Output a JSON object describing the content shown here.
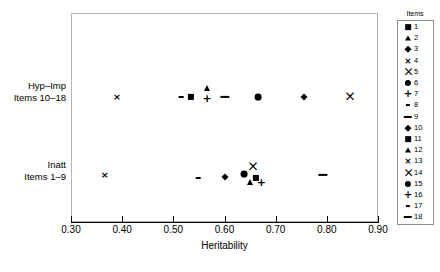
{
  "chart_data": {
    "type": "scatter",
    "title": "",
    "xlabel": "Heritability",
    "ylabel": "",
    "xlim": [
      0.3,
      0.9
    ],
    "xticks": [
      "0.30",
      "0.40",
      "0.50",
      "0.60",
      "0.70",
      "0.80",
      "0.90"
    ],
    "xtick_values": [
      0.3,
      0.4,
      0.5,
      0.6,
      0.7,
      0.8,
      0.9
    ],
    "grid": false,
    "legend_position": "right",
    "legend_title": "Items",
    "categories": [
      {
        "id": "hyp-imp",
        "line1": "Hyp–Imp",
        "line2": "Items 10–18"
      },
      {
        "id": "inatt",
        "line1": "Inatt",
        "line2": "Items 1–9"
      }
    ],
    "legend_entries": [
      {
        "label": "1",
        "marker": "square"
      },
      {
        "label": "2",
        "marker": "triangle"
      },
      {
        "label": "3",
        "marker": "diamond"
      },
      {
        "label": "4",
        "marker": "cross-x"
      },
      {
        "label": "5",
        "marker": "bowtie-x"
      },
      {
        "label": "6",
        "marker": "circle"
      },
      {
        "label": "7",
        "marker": "plus"
      },
      {
        "label": "8",
        "marker": "short-dash"
      },
      {
        "label": "9",
        "marker": "long-dash"
      },
      {
        "label": "10",
        "marker": "diamond"
      },
      {
        "label": "11",
        "marker": "square"
      },
      {
        "label": "12",
        "marker": "triangle"
      },
      {
        "label": "13",
        "marker": "cross-x"
      },
      {
        "label": "14",
        "marker": "bowtie-x"
      },
      {
        "label": "15",
        "marker": "circle"
      },
      {
        "label": "16",
        "marker": "plus"
      },
      {
        "label": "17",
        "marker": "short-dash"
      },
      {
        "label": "18",
        "marker": "long-dash"
      }
    ],
    "points": [
      {
        "item": "13",
        "category": "hyp-imp",
        "x": 0.39,
        "marker": "cross-x",
        "dy": 0
      },
      {
        "item": "17",
        "category": "hyp-imp",
        "x": 0.515,
        "marker": "short-dash",
        "dy": 0
      },
      {
        "item": "11",
        "category": "hyp-imp",
        "x": 0.535,
        "marker": "square",
        "dy": 0
      },
      {
        "item": "12",
        "category": "hyp-imp",
        "x": 0.566,
        "marker": "triangle",
        "dy": -9
      },
      {
        "item": "16",
        "category": "hyp-imp",
        "x": 0.566,
        "marker": "plus",
        "dy": 1
      },
      {
        "item": "18",
        "category": "hyp-imp",
        "x": 0.601,
        "marker": "long-dash",
        "dy": 0
      },
      {
        "item": "15",
        "category": "hyp-imp",
        "x": 0.665,
        "marker": "circle",
        "dy": 0
      },
      {
        "item": "10",
        "category": "hyp-imp",
        "x": 0.756,
        "marker": "diamond",
        "dy": 0
      },
      {
        "item": "14",
        "category": "hyp-imp",
        "x": 0.845,
        "marker": "bowtie-x",
        "dy": 0
      },
      {
        "item": "4",
        "category": "inatt",
        "x": 0.366,
        "marker": "cross-x",
        "dy": 0
      },
      {
        "item": "8",
        "category": "inatt",
        "x": 0.549,
        "marker": "short-dash",
        "dy": 3
      },
      {
        "item": "3",
        "category": "inatt",
        "x": 0.601,
        "marker": "diamond",
        "dy": 2
      },
      {
        "item": "6",
        "category": "inatt",
        "x": 0.639,
        "marker": "circle",
        "dy": -1
      },
      {
        "item": "5",
        "category": "inatt",
        "x": 0.655,
        "marker": "bowtie-x",
        "dy": -8
      },
      {
        "item": "2",
        "category": "inatt",
        "x": 0.65,
        "marker": "triangle",
        "dy": 7
      },
      {
        "item": "1",
        "category": "inatt",
        "x": 0.661,
        "marker": "square",
        "dy": 3
      },
      {
        "item": "7",
        "category": "inatt",
        "x": 0.672,
        "marker": "plus",
        "dy": 7
      },
      {
        "item": "9",
        "category": "inatt",
        "x": 0.792,
        "marker": "long-dash",
        "dy": 0
      }
    ]
  },
  "colors": {
    "marker": "#000000",
    "frame": "#b5b5b5",
    "axis": "#000000",
    "background": "#ffffff"
  }
}
